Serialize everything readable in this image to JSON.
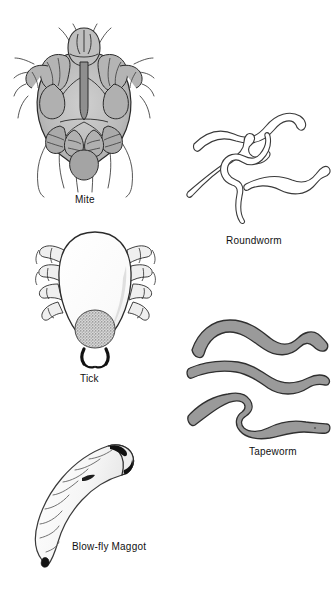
{
  "plate": {
    "title": "Common animal parasites illustration plate",
    "background_color": "#ffffff",
    "width": 336,
    "height": 603
  },
  "palette": {
    "ink": "#1a1a1a",
    "outline_gray": "#4a4a4a",
    "mite_body_fill": "#bdbdbd",
    "mite_shade_fill": "#a6a6a6",
    "tick_body_fill": "#fbfbfb",
    "tick_capitulum_fill": "#a8a8a8",
    "tapeworm_fill": "#9a9a9a",
    "roundworm_fill": "#ffffff",
    "maggot_fill": "#f4f4f4",
    "caption_color": "#111111"
  },
  "figures": [
    {
      "id": "mite",
      "caption": "Mite",
      "icon": "mite-illustration",
      "description": "Ventral view of a mite with rounded gray body, eight legs and long bristles"
    },
    {
      "id": "roundworm",
      "caption": "Roundworm",
      "icon": "roundworm-illustration",
      "description": "Four slender pale nematodes with sinuous S-curves",
      "count": 4
    },
    {
      "id": "tick",
      "caption": "Tick",
      "icon": "tick-illustration",
      "description": "Dorsal view of an engorged tick with pale teardrop body and stippled capitulum",
      "count": 1
    },
    {
      "id": "tapeworm",
      "caption": "Tapeworm",
      "icon": "tapeworm-illustration",
      "description": "Three thick gray flattened ribbon-like cestode segments",
      "count": 3
    },
    {
      "id": "maggot",
      "caption": "Blow-fly Maggot",
      "icon": "maggot-illustration",
      "description": "Curved segmented fly larva with dark anterior end and dark tail tip",
      "count": 1
    }
  ],
  "captions": {
    "mite": "Mite",
    "roundworm": "Roundworm",
    "tick": "Tick",
    "tapeworm": "Tapeworm",
    "maggot": "Blow-fly Maggot"
  }
}
